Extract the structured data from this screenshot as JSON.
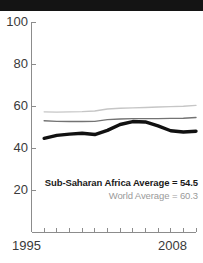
{
  "figure": {
    "title_band_text": "",
    "background": "#ffffff",
    "title_band_color": "#141414"
  },
  "legend": {
    "primary": "Sub-Saharan Africa Average = 54.5",
    "secondary": "World Average = 60.3",
    "primary_color": "#1a1a1a",
    "secondary_color": "#9a9a9a"
  },
  "axis": {
    "y_ticks": [
      "100",
      "80",
      "60",
      "40",
      "20"
    ],
    "x_start_label": "1995",
    "x_end_label": "2008",
    "axis_color": "#8c8c8c"
  },
  "chart_data": {
    "type": "line",
    "title": "",
    "xlabel": "",
    "ylabel": "",
    "xlim": [
      1995,
      2008
    ],
    "ylim": [
      0,
      100
    ],
    "yticks": [
      20,
      40,
      60,
      80,
      100
    ],
    "xticks": [
      1995,
      1996,
      1997,
      1998,
      1999,
      2000,
      2001,
      2002,
      2003,
      2004,
      2005,
      2006,
      2007,
      2008
    ],
    "grid": false,
    "legend_position": "inside-lower-right",
    "x": [
      1996,
      1997,
      1998,
      1999,
      2000,
      2001,
      2002,
      2003,
      2004,
      2005,
      2006,
      2007,
      2008
    ],
    "series": [
      {
        "name": "World Average",
        "color": "#c6c6c6",
        "width": 1.4,
        "annotation": "World Average = 60.3",
        "values": [
          57.2,
          57.1,
          57.2,
          57.3,
          57.6,
          58.6,
          58.9,
          59.1,
          59.3,
          59.5,
          59.7,
          59.9,
          60.3
        ]
      },
      {
        "name": "Middle series",
        "color": "#737373",
        "width": 1.4,
        "values": [
          53.0,
          52.7,
          52.6,
          52.6,
          52.7,
          53.5,
          53.8,
          54.0,
          54.0,
          54.0,
          54.1,
          54.2,
          54.5
        ]
      },
      {
        "name": "Sub-Saharan Africa Average",
        "color": "#111111",
        "width": 3.4,
        "annotation": "Sub-Saharan Africa Average = 54.5",
        "values": [
          44.6,
          46.0,
          46.6,
          47.0,
          46.4,
          48.4,
          51.2,
          52.6,
          52.4,
          50.5,
          48.2,
          47.6,
          48.0
        ]
      }
    ]
  }
}
